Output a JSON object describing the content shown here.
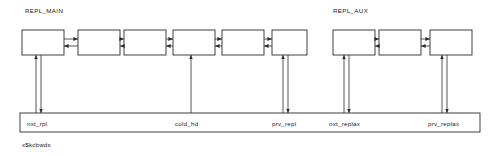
{
  "diagram": {
    "caption": "x$kcbwds",
    "groups": [
      {
        "id": "repl_main",
        "label": "REPL_MAIN",
        "label_x": 25,
        "label_y": 13,
        "node_count": 6
      },
      {
        "id": "repl_aux",
        "label": "REPL_AUX",
        "label_x": 333,
        "label_y": 13,
        "node_count": 3
      }
    ],
    "nodes": [
      {
        "id": "main-node-1",
        "group": "repl_main",
        "x": 22,
        "y": 30,
        "w": 42,
        "h": 25
      },
      {
        "id": "main-node-2",
        "group": "repl_main",
        "x": 78,
        "y": 30,
        "w": 42,
        "h": 25
      },
      {
        "id": "main-node-3",
        "group": "repl_main",
        "x": 124,
        "y": 30,
        "w": 42,
        "h": 25
      },
      {
        "id": "main-node-4",
        "group": "repl_main",
        "x": 173,
        "y": 30,
        "w": 42,
        "h": 25
      },
      {
        "id": "main-node-5",
        "group": "repl_main",
        "x": 222,
        "y": 30,
        "w": 42,
        "h": 25
      },
      {
        "id": "main-node-6",
        "group": "repl_main",
        "x": 272,
        "y": 30,
        "w": 35,
        "h": 25
      },
      {
        "id": "aux-node-1",
        "group": "repl_aux",
        "x": 333,
        "y": 30,
        "w": 42,
        "h": 25
      },
      {
        "id": "aux-node-2",
        "group": "repl_aux",
        "x": 379,
        "y": 30,
        "w": 42,
        "h": 25
      },
      {
        "id": "aux-node-3",
        "group": "repl_aux",
        "x": 430,
        "y": 30,
        "w": 42,
        "h": 25
      }
    ],
    "links": [
      {
        "id": "link-main-1-2",
        "x1": 64,
        "x2": 78,
        "y_fwd": 39,
        "y_rev": 46
      },
      {
        "id": "link-main-2-3",
        "x1": 120,
        "x2": 124,
        "y_fwd": 39,
        "y_rev": 46
      },
      {
        "id": "link-main-3-4",
        "x1": 166,
        "x2": 173,
        "y_fwd": 39,
        "y_rev": 46
      },
      {
        "id": "link-main-4-5",
        "x1": 215,
        "x2": 222,
        "y_fwd": 39,
        "y_rev": 46
      },
      {
        "id": "link-main-5-6",
        "x1": 264,
        "x2": 272,
        "y_fwd": 39,
        "y_rev": 46
      },
      {
        "id": "link-aux-1-2",
        "x1": 375,
        "x2": 379,
        "y_fwd": 39,
        "y_rev": 46
      },
      {
        "id": "link-aux-2-3",
        "x1": 421,
        "x2": 430,
        "y_fwd": 39,
        "y_rev": 46
      }
    ],
    "struct_bar": {
      "x": 20,
      "y": 113,
      "w": 460,
      "h": 19
    },
    "pointers": [
      {
        "id": "nxt_rpl",
        "label": "nxt_rpl",
        "label_x": 27,
        "label_y": 126,
        "up_x": 36,
        "down_x": 41,
        "has_up": true,
        "has_down": true
      },
      {
        "id": "cold_hd",
        "label": "cold_hd",
        "label_x": 175,
        "label_y": 126,
        "up_x": 191,
        "down_x": 0,
        "has_up": true,
        "has_down": false
      },
      {
        "id": "prv_repl",
        "label": "prv_repl",
        "label_x": 272,
        "label_y": 126,
        "up_x": 283,
        "down_x": 288,
        "has_up": true,
        "has_down": true
      },
      {
        "id": "nxt_replax",
        "label": "nxt_replax",
        "label_x": 329,
        "label_y": 126,
        "up_x": 344,
        "down_x": 349,
        "has_up": true,
        "has_down": true
      },
      {
        "id": "prv_replax",
        "label": "prv_replax",
        "label_x": 428,
        "label_y": 126,
        "up_x": 442,
        "down_x": 447,
        "has_up": true,
        "has_down": true
      }
    ],
    "caption_pos": {
      "x": 22,
      "y": 147
    }
  }
}
